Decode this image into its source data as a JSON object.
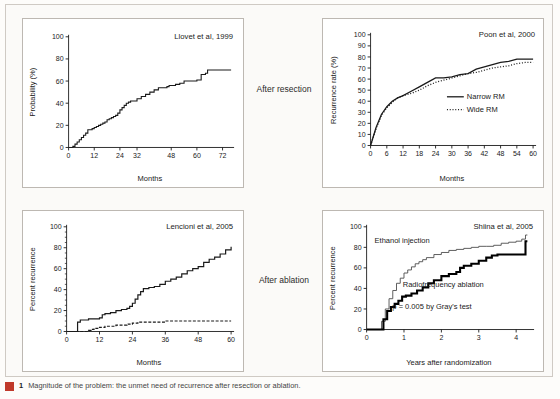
{
  "figure": {
    "caption_number": "1",
    "caption_text": "Magnitude of the problem: the unmet need of recurrence after resection or ablation.",
    "marker_color": "#c0392b"
  },
  "middle_labels": {
    "resection": "After resection",
    "ablation": "After ablation"
  },
  "chart_data": [
    {
      "id": "panel-1",
      "type": "line",
      "title": "Llovet et al, 1999",
      "xlabel": "Months",
      "ylabel": "Probability (%)",
      "xlim": [
        0,
        76
      ],
      "ylim": [
        0,
        100
      ],
      "xticks": [
        0,
        12,
        24,
        32,
        48,
        60,
        72
      ],
      "yticks": [
        0,
        20,
        40,
        60,
        80,
        100
      ],
      "grid": false,
      "legend": null,
      "series": [
        {
          "name": "Recurrence probability",
          "style": "solid",
          "width": 1.1,
          "color": "#1a1a1a",
          "step": true,
          "x": [
            0,
            1,
            2,
            3,
            4,
            5,
            6,
            7,
            8,
            9,
            10,
            11,
            12,
            13,
            14,
            15,
            16,
            17,
            18,
            19,
            20,
            21,
            22,
            23,
            24,
            25,
            26,
            27,
            28,
            29,
            30,
            31,
            32,
            34,
            36,
            38,
            40,
            42,
            44,
            46,
            47,
            48,
            50,
            52,
            54,
            56,
            58,
            59,
            60,
            62,
            64,
            65,
            68,
            72,
            76
          ],
          "y": [
            0,
            0,
            1,
            3,
            5,
            7,
            9,
            11,
            13,
            16,
            16,
            17,
            18,
            19,
            20,
            21,
            22,
            23,
            25,
            26,
            27,
            28,
            29,
            31,
            34,
            36,
            38,
            40,
            41,
            42,
            42,
            42,
            44,
            46,
            48,
            50,
            52,
            54,
            54,
            55,
            56,
            56,
            57,
            58,
            60,
            60,
            60,
            60,
            61,
            66,
            67,
            70,
            70,
            70,
            70
          ]
        }
      ]
    },
    {
      "id": "panel-2",
      "type": "line",
      "title": "Poon et al, 2000",
      "xlabel": "Months",
      "ylabel": "Recurrence rate (%)",
      "xlim": [
        0,
        60
      ],
      "ylim": [
        0,
        100
      ],
      "xticks": [
        0,
        6,
        12,
        18,
        24,
        30,
        36,
        42,
        48,
        54,
        60
      ],
      "yticks": [
        0,
        10,
        20,
        30,
        40,
        50,
        60,
        70,
        80,
        90,
        100
      ],
      "grid": false,
      "legend": {
        "position": "inside-right",
        "entries": [
          {
            "label": "Narrow RM",
            "style": "solid"
          },
          {
            "label": "Wide RM",
            "style": "dotted"
          }
        ]
      },
      "series": [
        {
          "name": "Narrow RM",
          "style": "solid",
          "width": 1.3,
          "color": "#1a1a1a",
          "step": false,
          "x": [
            0,
            2,
            4,
            6,
            8,
            10,
            12,
            15,
            18,
            21,
            24,
            27,
            30,
            33,
            36,
            39,
            42,
            45,
            48,
            51,
            54,
            57,
            60
          ],
          "y": [
            0,
            16,
            28,
            35,
            40,
            43,
            45,
            49,
            53,
            57,
            61,
            61,
            62,
            64,
            65,
            69,
            71,
            73,
            75,
            76,
            78,
            78,
            78
          ]
        },
        {
          "name": "Wide RM",
          "style": "dotted",
          "width": 1.3,
          "color": "#1a1a1a",
          "step": false,
          "x": [
            0,
            2,
            4,
            6,
            8,
            10,
            12,
            15,
            18,
            21,
            24,
            27,
            30,
            33,
            36,
            39,
            42,
            45,
            48,
            51,
            54,
            57,
            60
          ],
          "y": [
            0,
            15,
            27,
            34,
            39,
            43,
            45,
            47,
            50,
            54,
            57,
            59,
            61,
            63,
            65,
            66,
            68,
            70,
            71,
            72,
            74,
            75,
            75
          ]
        }
      ]
    },
    {
      "id": "panel-3",
      "type": "line",
      "title": "Lencioni et al, 2005",
      "xlabel": "Months",
      "ylabel": "Percent recurrence",
      "xlim": [
        0,
        60
      ],
      "ylim": [
        0,
        100
      ],
      "xticks": [
        0,
        12,
        24,
        36,
        48,
        60
      ],
      "yticks": [
        0,
        20,
        40,
        60,
        80,
        100
      ],
      "grid": false,
      "legend": null,
      "series": [
        {
          "name": "Overall recurrence",
          "style": "solid",
          "width": 1.2,
          "color": "#1a1a1a",
          "step": true,
          "x": [
            0,
            3,
            4,
            5,
            6,
            8,
            10,
            12,
            13,
            14,
            16,
            18,
            20,
            21,
            22,
            23,
            24,
            25,
            26,
            27,
            28,
            30,
            32,
            34,
            36,
            38,
            40,
            42,
            44,
            46,
            48,
            50,
            52,
            54,
            56,
            58,
            60
          ],
          "y": [
            0,
            0,
            9,
            11,
            11,
            12,
            12,
            13,
            16,
            17,
            18,
            20,
            21,
            21,
            22,
            24,
            27,
            31,
            35,
            38,
            41,
            42,
            43,
            45,
            48,
            50,
            52,
            55,
            58,
            60,
            62,
            66,
            69,
            71,
            74,
            78,
            81
          ]
        },
        {
          "name": "Local recurrence",
          "style": "dashed",
          "width": 1.2,
          "color": "#1a1a1a",
          "step": true,
          "x": [
            0,
            6,
            8,
            9,
            10,
            12,
            14,
            16,
            18,
            20,
            22,
            24,
            26,
            28,
            30,
            33,
            36,
            40,
            44,
            48,
            52,
            56,
            60
          ],
          "y": [
            0,
            0,
            1,
            2,
            3,
            4,
            5,
            5,
            6,
            6,
            7,
            8,
            9,
            9,
            9,
            9,
            10,
            10,
            10,
            10,
            10,
            10,
            10
          ]
        }
      ]
    },
    {
      "id": "panel-4",
      "type": "line",
      "title": "Shiina et al, 2005",
      "xlabel": "Years after randomization",
      "ylabel": "Percent recurrence",
      "xlim": [
        0,
        4.4
      ],
      "ylim": [
        0,
        100
      ],
      "xticks": [
        0,
        1,
        2,
        3,
        4
      ],
      "yticks": [
        0,
        20,
        40,
        60,
        80,
        100
      ],
      "grid": false,
      "annotations": [
        {
          "text": "Ethanol injection",
          "x": 0.95,
          "y": 84
        },
        {
          "text": "Radiofrequency ablation",
          "x": 2.05,
          "y": 41
        },
        {
          "text": "p = 0.005 by Gray's test",
          "x": 1.75,
          "y": 20
        }
      ],
      "legend": null,
      "series": [
        {
          "name": "Ethanol injection",
          "style": "solid",
          "width": 0.9,
          "color": "#4a4a4a",
          "step": true,
          "x": [
            0,
            0.3,
            0.4,
            0.5,
            0.6,
            0.7,
            0.8,
            0.9,
            1.0,
            1.1,
            1.2,
            1.3,
            1.4,
            1.5,
            1.6,
            1.8,
            2.0,
            2.2,
            2.4,
            2.6,
            2.8,
            3.0,
            3.2,
            3.4,
            3.6,
            3.8,
            4.0,
            4.15,
            4.25,
            4.3
          ],
          "y": [
            0,
            0,
            8,
            20,
            30,
            38,
            45,
            50,
            55,
            58,
            61,
            64,
            66,
            68,
            70,
            73,
            75,
            77,
            78,
            79,
            80,
            81,
            81,
            82,
            84,
            85,
            86,
            88,
            92,
            92
          ]
        },
        {
          "name": "Radiofrequency ablation",
          "style": "solid",
          "width": 2.1,
          "color": "#000000",
          "step": true,
          "x": [
            0,
            0.35,
            0.45,
            0.55,
            0.65,
            0.75,
            0.85,
            0.95,
            1.05,
            1.2,
            1.35,
            1.5,
            1.65,
            1.8,
            2.0,
            2.2,
            2.4,
            2.5,
            2.6,
            2.8,
            3.0,
            3.2,
            3.35,
            3.5,
            3.8,
            4.1,
            4.25,
            4.3
          ],
          "y": [
            0,
            0,
            10,
            18,
            22,
            25,
            28,
            32,
            33,
            35,
            38,
            41,
            45,
            48,
            52,
            54,
            56,
            60,
            62,
            64,
            67,
            70,
            72,
            73,
            73,
            73,
            86,
            86
          ]
        }
      ]
    }
  ]
}
